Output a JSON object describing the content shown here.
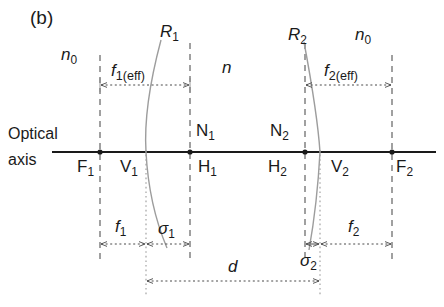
{
  "figure": {
    "panel_label": "(b)",
    "caption_type": "optical-ray-diagram",
    "background_color": "#ffffff",
    "line_color": "#3a3a3a",
    "axis_color": "#1a1a1a"
  },
  "axis": {
    "label_line1": "Optical",
    "label_line2": "axis",
    "y": 152,
    "x_start": 52,
    "x_end": 436
  },
  "media": {
    "left_index": "n",
    "left_index_sub": "0",
    "middle_index": "n",
    "right_index": "n",
    "right_index_sub": "0"
  },
  "surfaces": [
    {
      "name": "R1",
      "label": "R",
      "label_sub": "1",
      "vertex_label": "V",
      "vertex_sub": "1",
      "vertex_x": 146,
      "principal_label": "H",
      "principal_sub": "1",
      "nodal_label": "N",
      "nodal_sub": "1",
      "nodal_x": 190,
      "focal_label": "F",
      "focal_sub": "1",
      "focal_x": 100
    },
    {
      "name": "R2",
      "label": "R",
      "label_sub": "2",
      "vertex_label": "V",
      "vertex_sub": "2",
      "vertex_x": 320,
      "principal_label": "H",
      "principal_sub": "2",
      "nodal_label": "N",
      "nodal_sub": "2",
      "nodal_x": 305,
      "focal_label": "F",
      "focal_sub": "2",
      "focal_x": 392
    }
  ],
  "dimensions": [
    {
      "name": "f1-eff",
      "label": "f",
      "label_sub": "1(eff)",
      "from_x": 100,
      "to_x": 190,
      "y": 85
    },
    {
      "name": "f2-eff",
      "label": "f",
      "label_sub": "2(eff)",
      "from_x": 305,
      "to_x": 392,
      "y": 85
    },
    {
      "name": "f1",
      "label": "f",
      "label_sub": "1",
      "from_x": 100,
      "to_x": 146,
      "y": 244
    },
    {
      "name": "sigma1",
      "label": "σ",
      "label_sub": "1",
      "from_x": 146,
      "to_x": 190,
      "y": 244
    },
    {
      "name": "sigma2",
      "label": "σ",
      "label_sub": "2",
      "from_x": 305,
      "to_x": 320,
      "y": 244
    },
    {
      "name": "f2",
      "label": "f",
      "label_sub": "2",
      "from_x": 320,
      "to_x": 392,
      "y": 244
    },
    {
      "name": "d",
      "label": "d",
      "label_sub": "",
      "from_x": 146,
      "to_x": 320,
      "y": 281
    }
  ],
  "vertical_lines": [
    {
      "name": "F1-line",
      "x": 100,
      "style": "dashed",
      "y1": 55,
      "y2": 262
    },
    {
      "name": "H1-line",
      "x": 190,
      "style": "dashed",
      "y1": 43,
      "y2": 262
    },
    {
      "name": "V1-line",
      "x": 146,
      "style": "dotted",
      "y1": 150,
      "y2": 296
    },
    {
      "name": "N2-line",
      "x": 305,
      "style": "dashed",
      "y1": 43,
      "y2": 262
    },
    {
      "name": "V2-line",
      "x": 320,
      "style": "dotted",
      "y1": 150,
      "y2": 296
    },
    {
      "name": "F2-line",
      "x": 392,
      "style": "dashed",
      "y1": 55,
      "y2": 262
    }
  ]
}
